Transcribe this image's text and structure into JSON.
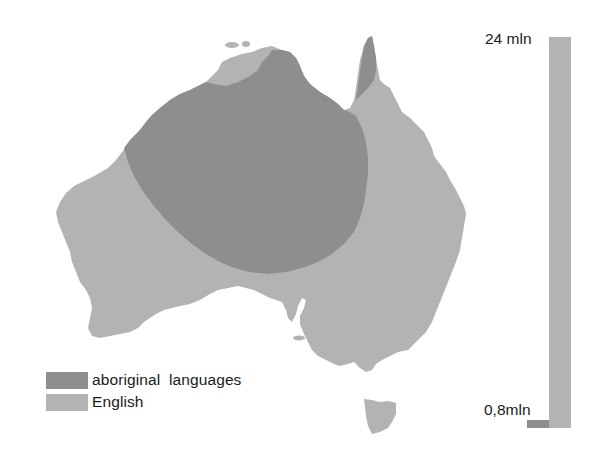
{
  "map": {
    "title": "Languages of Australia",
    "regions": [
      {
        "id": "english",
        "label": "English",
        "color": "#b3b3b3"
      },
      {
        "id": "aboriginal",
        "label": "aboriginal  languages",
        "color": "#8e8e8e"
      }
    ]
  },
  "legend": {
    "items": [
      {
        "label": "aboriginal  languages",
        "color": "#8e8e8e"
      },
      {
        "label": "English",
        "color": "#b3b3b3"
      }
    ]
  },
  "speakers_bar": {
    "top_label": "24 mln",
    "bottom_label": "0,8mln",
    "series": [
      {
        "name": "English",
        "value_mln": 24,
        "color": "#b3b3b3"
      },
      {
        "name": "aboriginal languages",
        "value_mln": 0.8,
        "color": "#8e8e8e"
      }
    ]
  }
}
